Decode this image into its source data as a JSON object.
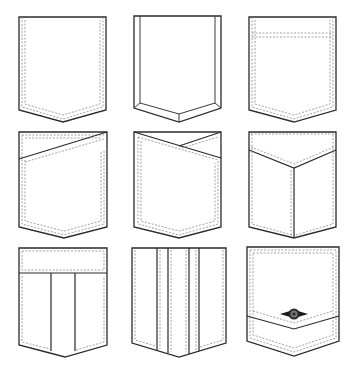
{
  "colors": {
    "background": "#ffffff",
    "outline": "#2a2a2a",
    "stitch": "#8a8a8a"
  },
  "grid": {
    "columns": 3,
    "rows": 3
  },
  "pockets": [
    {
      "id": 1,
      "style": "plain-pointed",
      "features": [
        "double-stitch-sides-bottom"
      ]
    },
    {
      "id": 2,
      "style": "beveled-edge",
      "features": [
        "inner-bevel-border"
      ]
    },
    {
      "id": 3,
      "style": "top-band",
      "features": [
        "double-stitch-all",
        "stitched-top-band"
      ]
    },
    {
      "id": 4,
      "style": "diagonal-flap",
      "features": [
        "single-diagonal-overlap"
      ]
    },
    {
      "id": 5,
      "style": "crossover-flap",
      "features": [
        "double-diagonal-overlap"
      ]
    },
    {
      "id": 6,
      "style": "v-flap-center-pleat",
      "features": [
        "v-flap",
        "center-seam"
      ]
    },
    {
      "id": 7,
      "style": "band-box-pleat",
      "features": [
        "top-band",
        "two-vertical-seams"
      ]
    },
    {
      "id": 8,
      "style": "multi-pleat",
      "features": [
        "four-vertical-seams",
        "stitched-panels"
      ]
    },
    {
      "id": 9,
      "style": "chevron-band-button",
      "features": [
        "chevron-band",
        "button-with-tabs"
      ]
    }
  ]
}
